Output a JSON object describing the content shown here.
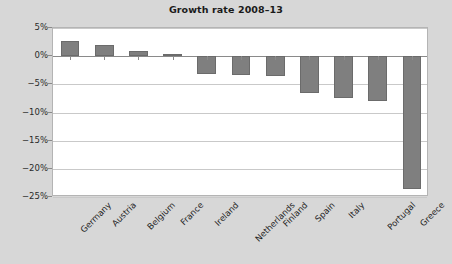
{
  "chart_data": {
    "type": "bar",
    "title": "Growth rate 2008–13",
    "xlabel": "",
    "ylabel": "",
    "categories": [
      "Germany",
      "Austria",
      "Belgium",
      "France",
      "Ireland",
      "Netherlands",
      "Finland",
      "Spain",
      "Italy",
      "Portugal",
      "Greece"
    ],
    "values": [
      2.7,
      2.0,
      1.0,
      0.3,
      -3.2,
      -3.4,
      -3.5,
      -6.5,
      -7.5,
      -8.0,
      -23.5
    ],
    "value_labels": [
      "2.7%",
      "2.0%",
      "1.0%",
      "0.3%",
      "-3.2%",
      "-3.4%",
      "-3.5%",
      "-6.5%",
      "-7.5%",
      "-8.0%",
      "-23.5%"
    ],
    "ylim": [
      -25,
      5
    ],
    "yticks": [
      5,
      0,
      -5,
      -10,
      -15,
      -20,
      -25
    ],
    "ytick_labels": [
      "5%",
      "0%",
      "−5%",
      "−10%",
      "−15%",
      "−20%",
      "−25%"
    ],
    "grid": true,
    "legend": null,
    "bar_color": "#7f7f7f",
    "bar_edge_color": "#6b6b6b",
    "plot_background": "#ffffff",
    "figure_background": "#d7d7d7",
    "gridline_color": "#c9c9c9",
    "axis_color": "#8a8a8a"
  }
}
